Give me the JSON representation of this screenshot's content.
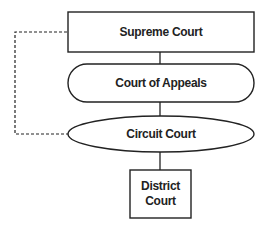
{
  "diagram": {
    "nodes": [
      {
        "id": "supreme",
        "label": "Supreme Court",
        "shape": "rectangle"
      },
      {
        "id": "appeals",
        "label": "Court of Appeals",
        "shape": "rounded-pill"
      },
      {
        "id": "circuit",
        "label": "Circuit Court",
        "shape": "ellipse"
      },
      {
        "id": "district",
        "label": "District\nCourt",
        "shape": "rectangle"
      }
    ],
    "edges": [
      {
        "from": "supreme",
        "to": "appeals",
        "style": "solid"
      },
      {
        "from": "appeals",
        "to": "circuit",
        "style": "solid"
      },
      {
        "from": "circuit",
        "to": "district",
        "style": "solid"
      },
      {
        "from": "supreme",
        "to": "circuit",
        "style": "dashed"
      }
    ],
    "colors": {
      "stroke": "#222222",
      "background": "#ffffff"
    }
  }
}
